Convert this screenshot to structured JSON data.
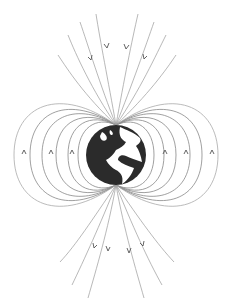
{
  "diagram": {
    "globe": {
      "label": "earth",
      "land_color": "#2b2b2b",
      "ocean_color": "#ffffff",
      "center": [
        116,
        155
      ],
      "radius": 30
    },
    "field_line_color": "#777777",
    "arrow_color": "#555555",
    "arrows": {
      "top": "pointing down (inward to north pole)",
      "sides": "pointing up",
      "bottom": "pointing down (away from south pole)"
    }
  }
}
